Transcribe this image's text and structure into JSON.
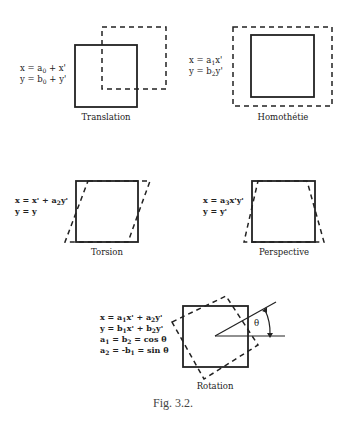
{
  "figure": {
    "caption": "Fig. 3.2.",
    "panels": [
      {
        "id": "translation",
        "label": "Translation",
        "equations": [
          {
            "lhs": "x = a",
            "sub": "0",
            "rhs": " + x'"
          },
          {
            "lhs": "y = b",
            "sub": "0",
            "rhs": " + y'"
          }
        ]
      },
      {
        "id": "homothetie",
        "label": "Homothétie",
        "equations": [
          {
            "lhs": "x = a",
            "sub": "1",
            "rhs": "x'"
          },
          {
            "lhs": "y = b",
            "sub": "2",
            "rhs": "y'"
          }
        ]
      },
      {
        "id": "torsion",
        "label": "Torsion",
        "equations": [
          {
            "lhs": "x = x' + a",
            "sub": "2",
            "rhs": "y'"
          },
          {
            "lhs": "y = y",
            "sub": "",
            "rhs": ""
          }
        ]
      },
      {
        "id": "perspective",
        "label": "Perspective",
        "equations": [
          {
            "lhs": "x = a",
            "sub": "3",
            "rhs": "x'y'"
          },
          {
            "lhs": "y = y'",
            "sub": "",
            "rhs": ""
          }
        ]
      },
      {
        "id": "rotation",
        "label": "Rotation",
        "angle_symbol": "θ",
        "equations": [
          {
            "lhs": "x = a",
            "sub": "1",
            "mid": "x' + a",
            "sub2": "2",
            "rhs": "y'"
          },
          {
            "lhs": "y = b",
            "sub": "1",
            "mid": "x' + b",
            "sub2": "2",
            "rhs": "y'"
          },
          {
            "lhs": "a",
            "sub": "1",
            "mid": " = b",
            "sub2": "2",
            "rhs": " = cos θ"
          },
          {
            "lhs": "a",
            "sub": "2",
            "mid": " = -b",
            "sub2": "1",
            "rhs": " = sin θ"
          }
        ]
      }
    ]
  }
}
